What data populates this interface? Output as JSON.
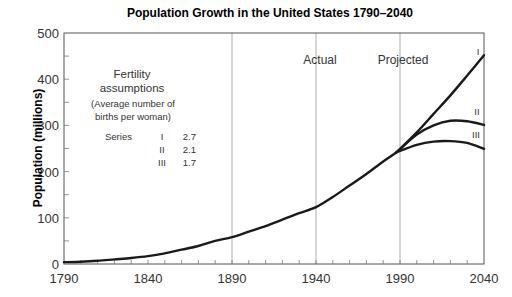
{
  "chart_data": {
    "type": "line",
    "title": "Population Growth in the United States 1790–2040",
    "xlabel": "",
    "ylabel": "Population (millions)",
    "xlim": [
      1790,
      2040
    ],
    "ylim": [
      0,
      500
    ],
    "x_ticks": [
      "1790",
      "1840",
      "1890",
      "1940",
      "1990",
      "2040"
    ],
    "y_ticks": [
      "0",
      "100",
      "200",
      "300",
      "400",
      "500"
    ],
    "grid": "vertical lines at 1890, 1940, 1990",
    "annotations": [
      "Actual",
      "Projected"
    ],
    "legend": {
      "title_line1": "Fertility",
      "title_line2": "assumptions",
      "subtitle_line1": "(Average number of",
      "subtitle_line2": "births per woman)",
      "series_label": "Series",
      "rows": [
        {
          "series": "I",
          "value": "2.7"
        },
        {
          "series": "II",
          "value": "2.1"
        },
        {
          "series": "III",
          "value": "1.7"
        }
      ]
    },
    "series": [
      {
        "name": "Actual",
        "x": [
          1790,
          1800,
          1810,
          1820,
          1830,
          1840,
          1850,
          1860,
          1870,
          1880,
          1890,
          1900,
          1910,
          1920,
          1930,
          1940,
          1950,
          1960,
          1970,
          1980,
          1988
        ],
        "values": [
          4,
          5,
          7,
          10,
          13,
          17,
          23,
          31,
          39,
          50,
          58,
          70,
          82,
          96,
          110,
          123,
          145,
          170,
          195,
          222,
          242
        ]
      },
      {
        "name": "I",
        "x": [
          1988,
          2000,
          2010,
          2020,
          2030,
          2040
        ],
        "values": [
          242,
          285,
          325,
          365,
          408,
          452
        ]
      },
      {
        "name": "II",
        "x": [
          1988,
          2000,
          2010,
          2020,
          2030,
          2040
        ],
        "values": [
          242,
          280,
          300,
          310,
          309,
          301
        ]
      },
      {
        "name": "III",
        "x": [
          1988,
          2000,
          2010,
          2020,
          2030,
          2040
        ],
        "values": [
          242,
          258,
          265,
          266,
          262,
          249
        ]
      }
    ],
    "series_labels": [
      "I",
      "II",
      "III"
    ]
  }
}
